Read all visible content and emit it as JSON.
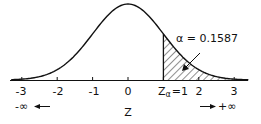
{
  "chart_data": {
    "type": "area",
    "title": "",
    "xlabel": "Z",
    "ylabel": "",
    "x_ticks": [
      -3,
      -2,
      -1,
      0,
      1,
      2,
      3
    ],
    "x_tick_labels": [
      "-3",
      "-2",
      "-1",
      "0",
      "Zα =1",
      "2",
      "3"
    ],
    "xlim": [
      -3.3,
      3.4
    ],
    "grid": false,
    "curve": {
      "distribution": "standard normal",
      "mean": 0,
      "sd": 1,
      "x": [
        -3,
        -2,
        -1,
        0,
        1,
        2,
        3
      ],
      "y": [
        0.0044,
        0.054,
        0.242,
        0.399,
        0.242,
        0.054,
        0.0044
      ]
    },
    "shaded_region": {
      "from": 1,
      "to": "+∞",
      "pattern": "diagonal hatch",
      "area": 0.1587
    },
    "annotations": {
      "alpha_label": "α = 0.1587",
      "z_alpha_label": "Zα =1",
      "neg_inf_label": "-∞",
      "pos_inf_label": "+∞"
    }
  },
  "axis": {
    "xlabel": "Z",
    "ticks": [
      "-3",
      "-2",
      "-1",
      "0",
      "2",
      "3"
    ],
    "z_alpha": "Z",
    "z_alpha_sub": "α",
    "z_alpha_eq": "=1"
  },
  "labels": {
    "alpha": "α = 0.1587",
    "neg_inf": "-∞",
    "pos_inf": "+∞"
  }
}
